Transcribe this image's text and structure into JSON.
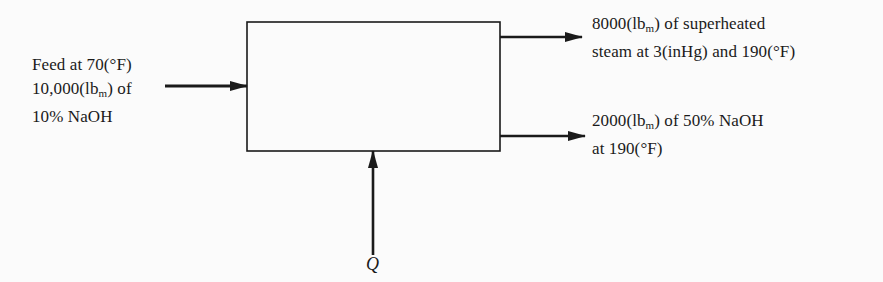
{
  "diagram": {
    "type": "process-flow-block-diagram",
    "unit": {
      "label": "evaporator"
    },
    "colors": {
      "line": "#1a1a1a",
      "background": "#fbfbfb"
    },
    "streams": {
      "feed": {
        "direction": "in",
        "lines": [
          {
            "pre": "Feed at 70(°F)",
            "sub": "",
            "post": ""
          },
          {
            "pre": "10,000(lb",
            "sub": "m",
            "post": ") of"
          },
          {
            "pre": "10% NaOH",
            "sub": "",
            "post": ""
          }
        ]
      },
      "vapor_outlet": {
        "direction": "out",
        "lines": [
          {
            "pre": "8000(lb",
            "sub": "m",
            "post": ") of superheated"
          },
          {
            "pre": "steam at 3(inHg) and 190(°F)",
            "sub": "",
            "post": ""
          }
        ]
      },
      "liquid_outlet": {
        "direction": "out",
        "lines": [
          {
            "pre": "2000(lb",
            "sub": "m",
            "post": ") of 50% NaOH"
          },
          {
            "pre": "at 190(°F)",
            "sub": "",
            "post": ""
          }
        ]
      },
      "heat": {
        "direction": "in",
        "label": "Q"
      }
    }
  }
}
